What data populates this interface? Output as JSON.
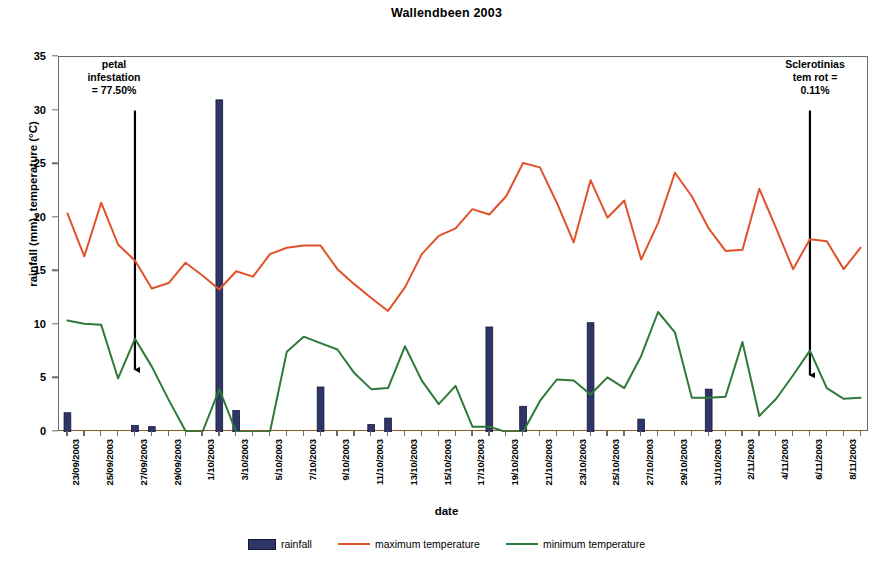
{
  "chart_data": {
    "type": "bar",
    "title": "Wallendbeen 2003",
    "xlabel": "date",
    "ylabel": "rainfall (mm), temperature (°C)",
    "ylim": [
      0,
      35
    ],
    "ytick_values": [
      0,
      5,
      10,
      15,
      20,
      25,
      30,
      35
    ],
    "grid": false,
    "legend_position": "bottom-center",
    "x": [
      "23/09/2003",
      "24/09/2003",
      "25/09/2003",
      "26/09/2003",
      "27/09/2003",
      "28/09/2003",
      "29/09/2003",
      "30/09/2003",
      "1/10/2003",
      "2/10/2003",
      "3/10/2003",
      "4/10/2003",
      "5/10/2003",
      "6/10/2003",
      "7/10/2003",
      "8/10/2003",
      "9/10/2003",
      "10/10/2003",
      "11/10/2003",
      "12/10/2003",
      "13/10/2003",
      "14/10/2003",
      "15/10/2003",
      "16/10/2003",
      "17/10/2003",
      "18/10/2003",
      "19/10/2003",
      "20/10/2003",
      "21/10/2003",
      "22/10/2003",
      "23/10/2003",
      "24/10/2003",
      "25/10/2003",
      "26/10/2003",
      "27/10/2003",
      "28/10/2003",
      "29/10/2003",
      "30/10/2003",
      "31/10/2003",
      "1/11/2003",
      "2/11/2003",
      "3/11/2003",
      "4/11/2003",
      "5/11/2003",
      "6/11/2003",
      "7/11/2003",
      "8/11/2003",
      "9/11/2003"
    ],
    "xtick_labels": [
      "23/09/2003",
      "25/09/2003",
      "27/09/2003",
      "29/09/2003",
      "1/10/2003",
      "3/10/2003",
      "5/10/2003",
      "7/10/2003",
      "9/10/2003",
      "11/10/2003",
      "13/10/2003",
      "15/10/2003",
      "17/10/2003",
      "19/10/2003",
      "21/10/2003",
      "23/10/2003",
      "25/10/2003",
      "27/10/2003",
      "29/10/2003",
      "31/10/2003",
      "2/11/2003",
      "4/11/2003",
      "6/11/2003",
      "8/11/2003"
    ],
    "series": [
      {
        "name": "rainfall",
        "type": "bar",
        "color": "#2f3566",
        "values": [
          1.8,
          0,
          0,
          0,
          0.6,
          0.5,
          0,
          0,
          0,
          31.0,
          2.0,
          0,
          0,
          0,
          0,
          4.2,
          0,
          0,
          0.7,
          1.3,
          0,
          0,
          0,
          0,
          0,
          9.8,
          0,
          2.4,
          0,
          0,
          0,
          10.2,
          0,
          0,
          1.2,
          0,
          0,
          0,
          4.0,
          0,
          0,
          0,
          0,
          0,
          0,
          0,
          0,
          0
        ]
      },
      {
        "name": "maximum temperature",
        "type": "line",
        "color": "#e0522a",
        "values": [
          20.4,
          16.4,
          21.4,
          17.5,
          16.0,
          13.4,
          13.9,
          15.8,
          14.6,
          13.3,
          15.0,
          14.5,
          16.6,
          17.2,
          17.4,
          17.4,
          15.2,
          13.8,
          12.5,
          11.3,
          13.5,
          16.6,
          18.3,
          19.0,
          20.8,
          20.3,
          22.0,
          25.1,
          24.7,
          21.4,
          17.7,
          23.5,
          20.0,
          21.6,
          16.1,
          19.5,
          24.2,
          22.0,
          19.0,
          16.9,
          17.0,
          22.7,
          19.0,
          15.2,
          18.0,
          17.8,
          15.2,
          17.2
        ]
      },
      {
        "name": "minimum temperature",
        "type": "line",
        "color": "#2f7a39",
        "values": [
          10.4,
          10.1,
          10.0,
          5.0,
          8.7,
          6.1,
          3.0,
          0.1,
          0.0,
          4.0,
          0.0,
          0.0,
          0.0,
          7.5,
          8.9,
          8.3,
          7.7,
          5.5,
          4.0,
          4.1,
          8.0,
          4.8,
          2.6,
          4.3,
          0.5,
          0.5,
          0.0,
          0.0,
          2.9,
          4.9,
          4.8,
          3.5,
          5.1,
          4.1,
          7.1,
          11.2,
          9.3,
          3.2,
          3.2,
          3.3,
          8.4,
          1.5,
          3.1,
          5.3,
          7.6,
          4.1,
          3.1,
          3.2
        ]
      }
    ],
    "annotations": [
      {
        "id": "petal-infestation",
        "lines": [
          "petal",
          "infestation",
          "= 77.50%"
        ],
        "arrow_x_index": 4,
        "arrow_top_value": 30.0,
        "arrow_bottom_value": 5.8
      },
      {
        "id": "sclerotinia-stem-rot",
        "lines": [
          "Sclerotinias",
          "tem rot =",
          "0.11%"
        ],
        "arrow_x_index": 44,
        "arrow_top_value": 30.0,
        "arrow_bottom_value": 5.3
      }
    ]
  },
  "legend": {
    "items": [
      {
        "label": "rainfall",
        "swatch": "bar",
        "color": "#2f3566"
      },
      {
        "label": "maximum temperature",
        "swatch": "line",
        "color": "#e0522a"
      },
      {
        "label": "minimum temperature",
        "swatch": "line",
        "color": "#2f7a39"
      }
    ]
  },
  "caption_fragment": ""
}
